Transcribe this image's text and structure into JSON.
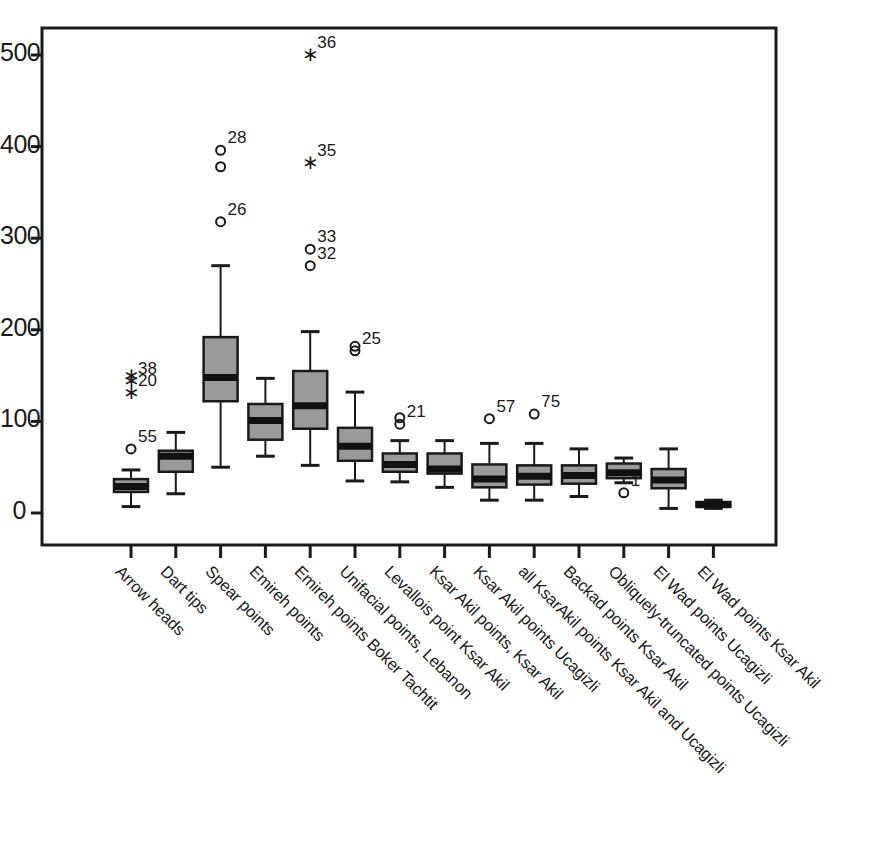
{
  "chart_data": {
    "type": "box",
    "title": "",
    "xlabel": "",
    "ylabel": "",
    "ylim": [
      0,
      530
    ],
    "yticks": [
      0,
      100,
      200,
      300,
      400,
      500
    ],
    "ytick_labels": [
      "0",
      "100",
      "200",
      "300",
      "400",
      "500"
    ],
    "grid": false,
    "legend": "none",
    "box_fill_color": "#9a9a9a",
    "box_line_color": "#1a1a1a",
    "median_color": "#111111",
    "categories": [
      "Arrow heads",
      "Dart tips",
      "Spear points",
      "Emireh points",
      "Emireh points Boker Tachtit",
      "Unifacial points, Lebanon",
      "Levallois point Ksar Akil",
      "Ksar Akil points, Ksar Akil",
      "Ksar Akil points Ucagizli",
      "all KsarAkil points Ksar Akil and Ucagizli",
      "Backad points Ksar Akil",
      "Obliquely-truncated points Ucagizli",
      "El Wad points Ucagizli",
      "El Wad points Ksar Akil"
    ],
    "boxes": [
      {
        "category": "Arrow heads",
        "whisker_low": 7,
        "q1": 23,
        "median": 29,
        "q3": 37,
        "whisker_high": 47,
        "outliers": [
          {
            "value": 70,
            "marker": "circle",
            "label": "55"
          },
          {
            "value": 131,
            "marker": "star",
            "label": "20"
          },
          {
            "value": 144,
            "marker": "star",
            "label": "38"
          },
          {
            "value": 150,
            "marker": "star",
            "label": ""
          }
        ]
      },
      {
        "category": "Dart tips",
        "whisker_low": 21,
        "q1": 45,
        "median": 62,
        "q3": 68,
        "whisker_high": 88,
        "outliers": []
      },
      {
        "category": "Spear points",
        "whisker_low": 50,
        "q1": 122,
        "median": 148,
        "q3": 192,
        "whisker_high": 270,
        "outliers": [
          {
            "value": 318,
            "marker": "circle",
            "label": "26"
          },
          {
            "value": 378,
            "marker": "circle",
            "label": ""
          },
          {
            "value": 396,
            "marker": "circle",
            "label": "28"
          }
        ]
      },
      {
        "category": "Emireh points",
        "whisker_low": 62,
        "q1": 80,
        "median": 101,
        "q3": 119,
        "whisker_high": 147,
        "outliers": []
      },
      {
        "category": "Emireh points Boker Tachtit",
        "whisker_low": 52,
        "q1": 92,
        "median": 117,
        "q3": 155,
        "whisker_high": 198,
        "outliers": [
          {
            "value": 270,
            "marker": "circle",
            "label": "32"
          },
          {
            "value": 288,
            "marker": "circle",
            "label": "33"
          },
          {
            "value": 382,
            "marker": "star",
            "label": "35"
          },
          {
            "value": 500,
            "marker": "star",
            "label": "36"
          }
        ]
      },
      {
        "category": "Unifacial points, Lebanon",
        "whisker_low": 35,
        "q1": 57,
        "median": 73,
        "q3": 93,
        "whisker_high": 132,
        "outliers": [
          {
            "value": 177,
            "marker": "circle",
            "label": "25"
          },
          {
            "value": 182,
            "marker": "circle",
            "label": ""
          }
        ]
      },
      {
        "category": "Levallois point Ksar Akil",
        "whisker_low": 34,
        "q1": 45,
        "median": 53,
        "q3": 65,
        "whisker_high": 79,
        "outliers": [
          {
            "value": 97,
            "marker": "circle",
            "label": "21"
          },
          {
            "value": 104,
            "marker": "circle",
            "label": ""
          }
        ]
      },
      {
        "category": "Ksar Akil points, Ksar Akil",
        "whisker_low": 28,
        "q1": 43,
        "median": 48,
        "q3": 65,
        "whisker_high": 79,
        "outliers": []
      },
      {
        "category": "Ksar Akil points Ucagizli",
        "whisker_low": 14,
        "q1": 28,
        "median": 37,
        "q3": 53,
        "whisker_high": 76,
        "outliers": [
          {
            "value": 103,
            "marker": "circle",
            "label": "57"
          }
        ]
      },
      {
        "category": "all KsarAkil points Ksar Akil and Ucagizli",
        "whisker_low": 14,
        "q1": 31,
        "median": 40,
        "q3": 52,
        "whisker_high": 76,
        "outliers": [
          {
            "value": 108,
            "marker": "circle",
            "label": "75"
          }
        ]
      },
      {
        "category": "Backad points Ksar Akil",
        "whisker_low": 18,
        "q1": 32,
        "median": 41,
        "q3": 52,
        "whisker_high": 70,
        "outliers": []
      },
      {
        "category": "Obliquely-truncated points Ucagizli",
        "whisker_low": 33,
        "q1": 38,
        "median": 44,
        "q3": 54,
        "whisker_high": 60,
        "outliers": [
          {
            "value": 22,
            "marker": "circle",
            "label": "1"
          }
        ]
      },
      {
        "category": "El Wad points Ucagizli",
        "whisker_low": 5,
        "q1": 27,
        "median": 36,
        "q3": 48,
        "whisker_high": 70,
        "outliers": []
      },
      {
        "category": "El Wad points Ksar Akil",
        "whisker_low": 5,
        "q1": 7,
        "median": 9,
        "q3": 12,
        "whisker_high": 14,
        "outliers": []
      }
    ]
  },
  "geometry": {
    "plot_left": 42,
    "plot_right": 776,
    "plot_top": 28,
    "plot_bottom": 545,
    "y_zero_px": 513,
    "y_500_px": 55,
    "first_tick_x": 131,
    "tick_spacing": 44.8,
    "box_width": 34
  }
}
